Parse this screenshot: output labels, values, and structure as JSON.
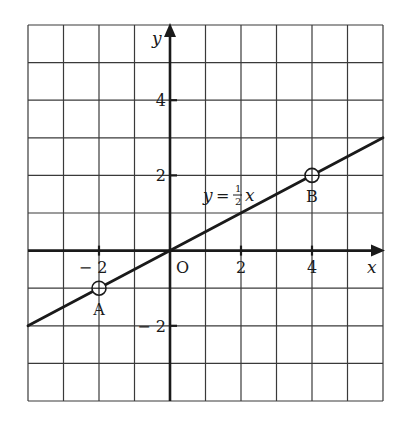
{
  "chart_data": {
    "type": "line",
    "title": "",
    "equation_label": "y = ½x",
    "equation": {
      "lhs": "y",
      "eq": "=",
      "num": "1",
      "den": "2",
      "var": "x"
    },
    "xlabel": "x",
    "ylabel": "y",
    "origin_label": "O",
    "xlim": [
      -4,
      6
    ],
    "ylim": [
      -4,
      6
    ],
    "grid": true,
    "grid_step": 1,
    "x_ticks": [
      {
        "value": -2,
        "label": "− 2"
      },
      {
        "value": 2,
        "label": "2"
      },
      {
        "value": 4,
        "label": "4"
      }
    ],
    "y_ticks": [
      {
        "value": 4,
        "label": "4"
      },
      {
        "value": 2,
        "label": "2"
      },
      {
        "value": -2,
        "label": "− 2"
      }
    ],
    "series": [
      {
        "name": "y = 1/2 x",
        "slope": 0.5,
        "intercept": 0,
        "x": [
          -4,
          6
        ],
        "y": [
          -2,
          3
        ]
      }
    ],
    "points": [
      {
        "name": "A",
        "x": -2,
        "y": -1
      },
      {
        "name": "B",
        "x": 4,
        "y": 2
      }
    ],
    "colors": {
      "ink": "#1a1a1a",
      "grid": "#333333",
      "background": "#ffffff"
    }
  }
}
